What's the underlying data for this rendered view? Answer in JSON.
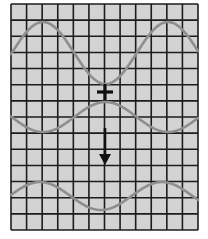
{
  "diagram": {
    "title": "",
    "grid": {
      "x": 11,
      "y": 4,
      "width": 187,
      "height": 226,
      "columns": 12,
      "rows": 14,
      "background": "#d3d3d3",
      "line_color": "#1c1c1c"
    },
    "waves": [
      {
        "name": "upper-wave",
        "center_y": 53,
        "amplitude": 31,
        "period": 125,
        "phase_peak_x": 43,
        "color": "#8e8e8e"
      },
      {
        "name": "middle-wave",
        "center_y": 117,
        "amplitude": -15,
        "period": 125,
        "phase_peak_x": 43,
        "color": "#8e8e8e"
      },
      {
        "name": "lower-wave",
        "center_y": 196,
        "amplitude": 14,
        "period": 122,
        "phase_peak_x": 40,
        "color": "#8e8e8e"
      }
    ],
    "markers": {
      "cross": {
        "x": 105,
        "y": 92,
        "size": 8,
        "color": "#111111"
      },
      "arrow": {
        "x": 105,
        "y1": 128,
        "y2": 165,
        "direction": "down",
        "color": "#111111"
      }
    }
  }
}
